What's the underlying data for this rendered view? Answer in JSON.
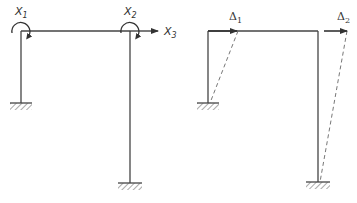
{
  "diagram": {
    "colors": {
      "member": "#444444",
      "deflected": "#777777",
      "hatch": "#555555",
      "text": "#333333"
    },
    "left_frame": {
      "labels": {
        "x1": {
          "base": "X",
          "sub": "1"
        },
        "x2": {
          "base": "X",
          "sub": "2"
        },
        "x3": {
          "base": "X",
          "sub": "3"
        }
      },
      "description": "Frame with fixed supports showing redundants X1, X2 (moments) and X3 (horizontal force)"
    },
    "right_frame": {
      "labels": {
        "d1": {
          "base": "Δ",
          "sub": "1"
        },
        "d2": {
          "base": "Δ",
          "sub": "2"
        }
      },
      "description": "Frame showing sway displacements Δ1 and Δ2 with deflected shape dashed"
    }
  }
}
